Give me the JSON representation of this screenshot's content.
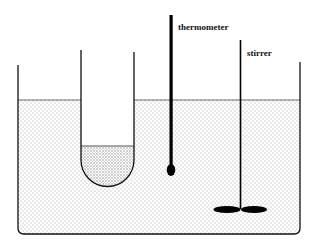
{
  "diagram": {
    "labels": {
      "thermometer": "thermometer",
      "stirrer": "stirrer"
    },
    "colors": {
      "line": "#111111",
      "liquid_dots": "#9a9a9a",
      "tube_liquid_dots": "#777777",
      "background": "#ffffff"
    }
  }
}
